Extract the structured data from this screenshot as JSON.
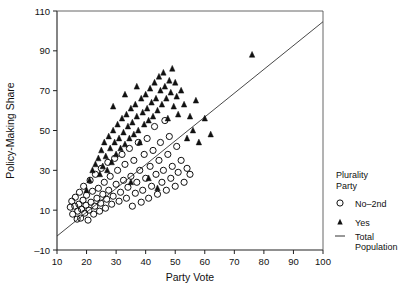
{
  "chart_data": {
    "type": "scatter",
    "title": "",
    "xlabel": "Party Vote",
    "ylabel": "Policy-Making Share",
    "xlim": [
      10,
      100
    ],
    "ylim": [
      -10,
      110
    ],
    "xticks": [
      10,
      20,
      30,
      40,
      50,
      60,
      70,
      80,
      90,
      100
    ],
    "yticks": [
      -10,
      10,
      30,
      50,
      70,
      90,
      110
    ],
    "grid": false,
    "legend": {
      "position": "right",
      "title_line1": "Plurality",
      "title_line2": "Party",
      "entries": [
        {
          "label": "No–2nd",
          "marker": "open-circle"
        },
        {
          "label": "Yes",
          "marker": "filled-triangle"
        },
        {
          "label_line1": "Total",
          "label_line2": "Population",
          "marker": "line"
        }
      ]
    },
    "series": [
      {
        "name": "No–2nd",
        "marker": "open-circle",
        "points": [
          [
            14.5,
            11.5
          ],
          [
            15.0,
            14.5
          ],
          [
            15.3,
            8.0
          ],
          [
            16.0,
            12.0
          ],
          [
            16.2,
            16.5
          ],
          [
            16.8,
            5.5
          ],
          [
            17.0,
            9.5
          ],
          [
            17.4,
            13.0
          ],
          [
            17.6,
            19.0
          ],
          [
            18.0,
            6.0
          ],
          [
            18.3,
            10.5
          ],
          [
            18.8,
            15.0
          ],
          [
            19.0,
            22.0
          ],
          [
            19.4,
            8.5
          ],
          [
            19.8,
            12.5
          ],
          [
            20.0,
            17.5
          ],
          [
            20.5,
            5.0
          ],
          [
            20.8,
            10.0
          ],
          [
            21.2,
            25.0
          ],
          [
            21.5,
            14.0
          ],
          [
            22.0,
            19.5
          ],
          [
            22.4,
            8.0
          ],
          [
            22.8,
            12.0
          ],
          [
            23.0,
            28.0
          ],
          [
            23.5,
            16.0
          ],
          [
            24.0,
            21.0
          ],
          [
            24.4,
            9.5
          ],
          [
            24.8,
            13.5
          ],
          [
            25.0,
            31.0
          ],
          [
            25.5,
            18.0
          ],
          [
            26.0,
            24.0
          ],
          [
            26.4,
            11.0
          ],
          [
            26.8,
            15.5
          ],
          [
            27.2,
            34.0
          ],
          [
            27.5,
            20.0
          ],
          [
            28.0,
            27.0
          ],
          [
            28.5,
            13.0
          ],
          [
            29.0,
            17.0
          ],
          [
            29.5,
            36.0
          ],
          [
            30.0,
            23.0
          ],
          [
            30.5,
            30.0
          ],
          [
            31.0,
            14.5
          ],
          [
            31.5,
            19.0
          ],
          [
            32.0,
            38.0
          ],
          [
            32.5,
            25.0
          ],
          [
            33.0,
            33.0
          ],
          [
            33.5,
            16.0
          ],
          [
            34.0,
            21.5
          ],
          [
            34.5,
            41.0
          ],
          [
            35.0,
            27.0
          ],
          [
            35.5,
            12.0
          ],
          [
            36.0,
            35.0
          ],
          [
            36.5,
            18.5
          ],
          [
            37.0,
            24.0
          ],
          [
            37.5,
            44.0
          ],
          [
            38.0,
            30.0
          ],
          [
            38.5,
            14.0
          ],
          [
            39.0,
            20.0
          ],
          [
            39.5,
            38.0
          ],
          [
            40.0,
            26.0
          ],
          [
            40.5,
            46.0
          ],
          [
            41.0,
            16.0
          ],
          [
            41.5,
            32.0
          ],
          [
            42.0,
            22.0
          ],
          [
            42.5,
            40.0
          ],
          [
            43.0,
            52.0
          ],
          [
            43.5,
            28.0
          ],
          [
            44.0,
            18.0
          ],
          [
            44.5,
            35.0
          ],
          [
            45.0,
            44.0
          ],
          [
            45.5,
            24.0
          ],
          [
            46.0,
            30.0
          ],
          [
            46.5,
            55.0
          ],
          [
            47.0,
            20.0
          ],
          [
            47.5,
            38.0
          ],
          [
            48.0,
            47.0
          ],
          [
            48.5,
            26.0
          ],
          [
            49.0,
            32.0
          ],
          [
            50.0,
            22.0
          ],
          [
            50.5,
            42.0
          ],
          [
            51.0,
            29.0
          ],
          [
            52.0,
            35.0
          ],
          [
            53.0,
            24.0
          ],
          [
            54.0,
            31.0
          ],
          [
            55.0,
            28.0
          ]
        ]
      },
      {
        "name": "Yes",
        "marker": "filled-triangle",
        "points": [
          [
            22.0,
            30.0
          ],
          [
            23.0,
            33.0
          ],
          [
            24.0,
            36.0
          ],
          [
            24.5,
            28.0
          ],
          [
            25.0,
            40.0
          ],
          [
            25.5,
            32.0
          ],
          [
            26.0,
            44.0
          ],
          [
            26.5,
            37.0
          ],
          [
            27.0,
            30.0
          ],
          [
            27.5,
            47.0
          ],
          [
            28.0,
            41.0
          ],
          [
            28.5,
            34.0
          ],
          [
            29.0,
            50.0
          ],
          [
            29.5,
            44.0
          ],
          [
            30.0,
            38.0
          ],
          [
            30.5,
            53.0
          ],
          [
            31.0,
            46.0
          ],
          [
            31.5,
            41.0
          ],
          [
            32.0,
            56.0
          ],
          [
            32.5,
            49.0
          ],
          [
            33.0,
            43.0
          ],
          [
            33.5,
            58.0
          ],
          [
            34.0,
            52.0
          ],
          [
            34.5,
            46.0
          ],
          [
            35.0,
            61.0
          ],
          [
            35.5,
            54.0
          ],
          [
            36.0,
            48.0
          ],
          [
            36.5,
            63.0
          ],
          [
            37.0,
            57.0
          ],
          [
            37.5,
            50.0
          ],
          [
            38.0,
            44.0
          ],
          [
            38.5,
            66.0
          ],
          [
            39.0,
            59.0
          ],
          [
            39.5,
            53.0
          ],
          [
            40.0,
            68.0
          ],
          [
            40.5,
            61.0
          ],
          [
            41.0,
            55.0
          ],
          [
            41.5,
            71.0
          ],
          [
            42.0,
            64.0
          ],
          [
            42.5,
            57.0
          ],
          [
            43.0,
            74.0
          ],
          [
            43.5,
            66.0
          ],
          [
            44.0,
            60.0
          ],
          [
            44.5,
            77.0
          ],
          [
            45.0,
            70.0
          ],
          [
            45.5,
            63.0
          ],
          [
            46.0,
            79.0
          ],
          [
            46.5,
            72.0
          ],
          [
            47.0,
            66.0
          ],
          [
            47.5,
            56.0
          ],
          [
            48.0,
            75.0
          ],
          [
            48.5,
            69.0
          ],
          [
            49.0,
            81.0
          ],
          [
            49.5,
            62.0
          ],
          [
            50.0,
            74.0
          ],
          [
            50.5,
            67.0
          ],
          [
            51.0,
            58.0
          ],
          [
            52.0,
            70.0
          ],
          [
            53.0,
            63.0
          ],
          [
            54.0,
            46.0
          ],
          [
            55.0,
            57.0
          ],
          [
            56.0,
            50.0
          ],
          [
            57.0,
            65.0
          ],
          [
            58.0,
            44.0
          ],
          [
            60.0,
            56.0
          ],
          [
            62.0,
            48.0
          ],
          [
            76.0,
            88.0
          ],
          [
            35.0,
            24.0
          ],
          [
            41.0,
            26.0
          ],
          [
            44.0,
            21.0
          ],
          [
            21.0,
            25.0
          ],
          [
            20.0,
            20.0
          ],
          [
            33.0,
            68.0
          ],
          [
            29.0,
            62.0
          ],
          [
            37.0,
            72.0
          ]
        ]
      }
    ],
    "fit_line": {
      "name": "Total Population",
      "x": [
        10.0,
        104.5
      ],
      "y": [
        -3.0,
        110.0
      ],
      "slope": 1.195,
      "intercept": -14.95
    }
  }
}
